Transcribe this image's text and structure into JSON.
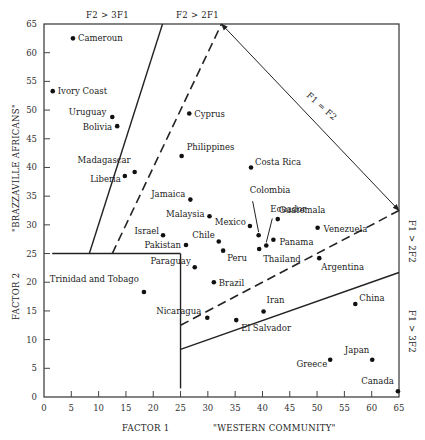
{
  "chart_data": {
    "type": "scatter",
    "title": "",
    "xlabel": "FACTOR 1",
    "xlabel_sub": "\"WESTERN COMMUNITY\"",
    "ylabel": "FACTOR 2",
    "ylabel_sub": "\"BRAZZAVILLE AFRICANS\"",
    "xlim": [
      0,
      65
    ],
    "ylim": [
      0,
      65
    ],
    "xticks": [
      0,
      5,
      10,
      15,
      20,
      25,
      30,
      35,
      40,
      45,
      50,
      55,
      60,
      65
    ],
    "yticks": [
      0,
      5,
      10,
      15,
      20,
      25,
      30,
      35,
      40,
      45,
      50,
      55,
      60,
      65
    ],
    "grid": false,
    "region_labels": {
      "top_left": "F2 > 3F1",
      "top_mid": "F2 > 2F1",
      "diagonal": "F1 = F2",
      "right_upper": "F1 > 2F2",
      "right_lower": "F1 > 3F2"
    },
    "points": [
      {
        "name": "Cameroun",
        "x": 5.3,
        "y": 62.5
      },
      {
        "name": "Ivory Coast",
        "x": 1.6,
        "y": 53.3
      },
      {
        "name": "Uruguay",
        "x": 12.5,
        "y": 48.8
      },
      {
        "name": "Bolivia",
        "x": 13.4,
        "y": 47.2
      },
      {
        "name": "Madagascar",
        "x": 16.6,
        "y": 39.2
      },
      {
        "name": "Liberia",
        "x": 14.8,
        "y": 38.5
      },
      {
        "name": "Cyprus",
        "x": 26.6,
        "y": 49.4
      },
      {
        "name": "Philippines",
        "x": 25.2,
        "y": 42.0
      },
      {
        "name": "Costa Rica",
        "x": 37.9,
        "y": 40.0
      },
      {
        "name": "Jamaica",
        "x": 26.8,
        "y": 34.4
      },
      {
        "name": "Malaysia",
        "x": 30.3,
        "y": 31.5
      },
      {
        "name": "Israel",
        "x": 21.8,
        "y": 28.2
      },
      {
        "name": "Pakistan",
        "x": 26.0,
        "y": 26.5
      },
      {
        "name": "Chile",
        "x": 32.0,
        "y": 27.1
      },
      {
        "name": "Peru",
        "x": 32.8,
        "y": 25.5
      },
      {
        "name": "Paraguay",
        "x": 27.6,
        "y": 22.6
      },
      {
        "name": "Brazil",
        "x": 31.1,
        "y": 20.0
      },
      {
        "name": "Mexico",
        "x": 37.7,
        "y": 29.8
      },
      {
        "name": "Colombia",
        "x": 39.3,
        "y": 28.2
      },
      {
        "name": "Ecuador",
        "x": 40.7,
        "y": 26.4
      },
      {
        "name": "Guatemala",
        "x": 42.8,
        "y": 31.0
      },
      {
        "name": "Panama",
        "x": 42.0,
        "y": 27.4
      },
      {
        "name": "Thailand",
        "x": 39.4,
        "y": 25.8
      },
      {
        "name": "Venezuela",
        "x": 50.1,
        "y": 29.5
      },
      {
        "name": "Argentina",
        "x": 50.4,
        "y": 24.2
      },
      {
        "name": "Trinidad and Tobago",
        "x": 18.3,
        "y": 18.3
      },
      {
        "name": "Nicaragua",
        "x": 29.9,
        "y": 13.8
      },
      {
        "name": "El Salvador",
        "x": 35.2,
        "y": 13.4
      },
      {
        "name": "Iran",
        "x": 40.2,
        "y": 14.9
      },
      {
        "name": "China",
        "x": 57.0,
        "y": 16.2
      },
      {
        "name": "Greece",
        "x": 52.4,
        "y": 6.5
      },
      {
        "name": "Japan",
        "x": 60.1,
        "y": 6.5
      },
      {
        "name": "Canada",
        "x": 64.8,
        "y": 1.0
      }
    ],
    "lines": [
      {
        "name": "F2 = 3F1",
        "style": "solid",
        "from": [
          8.3,
          25
        ],
        "to": [
          21.7,
          65
        ]
      },
      {
        "name": "F2 = 2F1",
        "style": "dashed",
        "from": [
          12.5,
          25
        ],
        "to": [
          32.5,
          65
        ]
      },
      {
        "name": "F1 = F2",
        "style": "arrow-double",
        "from": [
          32.5,
          65
        ],
        "to": [
          65,
          32.5
        ]
      },
      {
        "name": "F1 = 2F2",
        "style": "dashed",
        "from": [
          25,
          12.5
        ],
        "to": [
          65,
          32.5
        ]
      },
      {
        "name": "F1 = 3F2",
        "style": "solid",
        "from": [
          25,
          8.3
        ],
        "to": [
          65,
          21.7
        ]
      },
      {
        "name": "F2 = 25 boundary",
        "style": "solid",
        "from": [
          1.5,
          25
        ],
        "to": [
          25,
          25
        ]
      },
      {
        "name": "F1 = 25 boundary",
        "style": "solid",
        "from": [
          25,
          1.5
        ],
        "to": [
          25,
          25
        ]
      }
    ]
  }
}
